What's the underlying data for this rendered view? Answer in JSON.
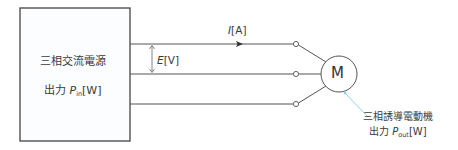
{
  "source": {
    "title": "三相交流電源",
    "output_prefix": "出力 ",
    "output_symbol": "P",
    "output_subscript": "in",
    "output_unit": "[W]"
  },
  "voltage": {
    "symbol": "E",
    "unit": "[V]"
  },
  "current": {
    "symbol": "I",
    "unit": "[A]"
  },
  "motor": {
    "symbol": "M",
    "title": "三相誘導電動機",
    "output_prefix": "出力 ",
    "output_symbol": "P",
    "output_subscript": "out",
    "output_unit": "[W]"
  },
  "colors": {
    "line": "#555555",
    "box_fill": "#fbfdff",
    "leader": "#8fd0e6"
  }
}
